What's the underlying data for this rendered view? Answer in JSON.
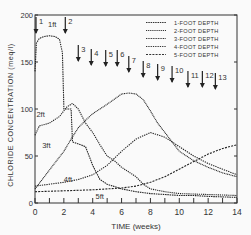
{
  "chart_data": {
    "type": "line",
    "title": "",
    "xlabel": "TIME (weeks)",
    "ylabel": "CHLORIDE CONCENTRATION (meq/l)",
    "xlim": [
      0,
      14
    ],
    "ylim": [
      0,
      200
    ],
    "xticks": [
      "0",
      "2",
      "4",
      "6",
      "8",
      "10",
      "12",
      "14"
    ],
    "yticks": [
      "0",
      "50",
      "100",
      "150",
      "200"
    ],
    "grid": false,
    "legend_position": "upper right",
    "series": [
      {
        "name": "1-FOOT DEPTH",
        "label": "1ft",
        "x": [
          0,
          0.1,
          0.3,
          0.6,
          1.0,
          1.4,
          1.7,
          1.9,
          2.0,
          2.5,
          2.6,
          3.5,
          4.0,
          4.5,
          5.0,
          6.0,
          7.0,
          8.0,
          9.0,
          10.0,
          11.0,
          12.0,
          14.0
        ],
        "y": [
          140,
          170,
          175,
          177,
          178,
          177,
          174,
          160,
          100,
          100,
          65,
          60,
          40,
          25,
          20,
          15,
          12,
          10,
          9,
          8,
          8,
          7,
          6
        ]
      },
      {
        "name": "2-FOOT DEPTH",
        "label": "2ft",
        "x": [
          0,
          0.3,
          1.0,
          1.7,
          2.2,
          2.6,
          3.0,
          3.5,
          4.0,
          4.5,
          5.0,
          5.5,
          6.0,
          6.5,
          7.0,
          7.5,
          8.0,
          9.0,
          10.0,
          12.0,
          14.0
        ],
        "y": [
          72,
          82,
          85,
          92,
          102,
          106,
          100,
          85,
          75,
          62,
          50,
          45,
          38,
          33,
          28,
          20,
          15,
          12,
          10,
          9,
          8
        ]
      },
      {
        "name": "3-FOOT DEPTH",
        "label": "3ft",
        "x": [
          0,
          0.5,
          1.0,
          1.5,
          2.0,
          2.5,
          3.0,
          3.5,
          4.0,
          5.0,
          6.0,
          6.5,
          7.0,
          7.5,
          8.0,
          8.5,
          9.0,
          10.0,
          11.0,
          12.0,
          13.0,
          14.0
        ],
        "y": [
          15,
          25,
          35,
          45,
          55,
          68,
          80,
          88,
          95,
          105,
          116,
          117,
          116,
          110,
          98,
          85,
          75,
          55,
          45,
          38,
          32,
          28
        ]
      },
      {
        "name": "4-FOOT DEPTH",
        "label": "4ft",
        "x": [
          0,
          1.0,
          2.0,
          3.0,
          4.0,
          5.0,
          6.0,
          7.0,
          8.0,
          9.0,
          10.0,
          11.0,
          12.0,
          13.0,
          14.0
        ],
        "y": [
          18,
          20,
          22,
          25,
          30,
          40,
          55,
          68,
          75,
          70,
          60,
          50,
          42,
          36,
          30
        ]
      },
      {
        "name": "5-FOOT DEPTH",
        "label": "5ft",
        "x": [
          0,
          2.0,
          4.0,
          6.0,
          7.0,
          8.0,
          9.0,
          10.0,
          11.0,
          12.0,
          13.0,
          14.0
        ],
        "y": [
          12,
          13,
          14,
          16,
          18,
          22,
          28,
          36,
          44,
          52,
          58,
          62
        ]
      }
    ],
    "annotations": [
      {
        "text": "1",
        "x": 0.0
      },
      {
        "text": "2",
        "x": 2.1
      },
      {
        "text": "3",
        "x": 3.0
      },
      {
        "text": "4",
        "x": 3.9
      },
      {
        "text": "5",
        "x": 4.9
      },
      {
        "text": "6",
        "x": 5.7
      },
      {
        "text": "7",
        "x": 6.5
      },
      {
        "text": "8",
        "x": 7.5
      },
      {
        "text": "9",
        "x": 8.5
      },
      {
        "text": "10",
        "x": 9.5
      },
      {
        "text": "11",
        "x": 10.6
      },
      {
        "text": "12",
        "x": 11.6
      },
      {
        "text": "13",
        "x": 12.5
      }
    ]
  },
  "legend": [
    "1-FOOT DEPTH",
    "2-FOOT DEPTH",
    "3-FOOT DEPTH",
    "4-FOOT DEPTH",
    "5-FOOT DEPTH"
  ]
}
